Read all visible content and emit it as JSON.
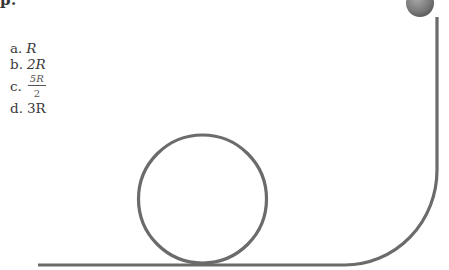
{
  "question": {
    "cutoff_heading": "p."
  },
  "options": [
    {
      "letter": "a.",
      "value": "R"
    },
    {
      "letter": "b.",
      "value": "2R"
    },
    {
      "letter": "c.",
      "numerator": "5R",
      "denominator": "2"
    },
    {
      "letter": "d.",
      "value": "3R"
    }
  ],
  "diagram": {
    "track_color": "#6b6b6b",
    "ball_color": "#7a7a7a",
    "loop": {
      "cx": 202.5,
      "cy": 199,
      "r": 65
    },
    "ball": {
      "cx": 420,
      "cy": 3,
      "r": 14
    },
    "ground_y": 265,
    "ground_start_x": 38,
    "vertical_track_x": 437
  }
}
